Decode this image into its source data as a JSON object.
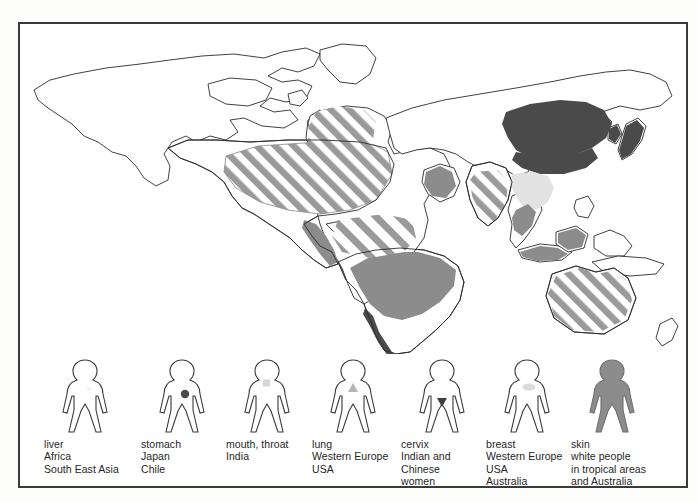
{
  "figure": {
    "frame_color": "#3a3a3a",
    "background": "#ffffff"
  },
  "palette": {
    "outline": "#2b2b2b",
    "dark_fill": "#4a4a4a",
    "mid_fill": "#8c8c8c",
    "stripe_fill": "#9a9a9a",
    "light_fill": "#e2e2e2",
    "very_light_fill": "#efefef",
    "text": "#262626"
  },
  "map": {
    "name": "world-outline-map",
    "projection_note": "flat world outline",
    "regions": [
      {
        "id": "north-america-usa",
        "label": "USA",
        "pattern": "diagonal-stripes",
        "cancer": "lung"
      },
      {
        "id": "south-america-brazil",
        "label": "Brazil / tropical South America",
        "pattern": "solid-mid",
        "cancer": "liver"
      },
      {
        "id": "chile-coast",
        "label": "Chile",
        "pattern": "solid-dark",
        "cancer": "stomach"
      },
      {
        "id": "central-america",
        "label": "Central America",
        "pattern": "solid-mid",
        "cancer": "liver"
      },
      {
        "id": "western-europe",
        "label": "Western Europe",
        "pattern": "diagonal-stripes",
        "cancer": "lung, breast"
      },
      {
        "id": "central-africa",
        "label": "Africa",
        "pattern": "diagonal-stripes-sparse",
        "cancer": "liver"
      },
      {
        "id": "middle-east-arabia",
        "label": "Arabian peninsula",
        "pattern": "solid-mid",
        "cancer": "liver"
      },
      {
        "id": "india",
        "label": "India",
        "pattern": "diagonal-stripes",
        "cancer": "mouth, throat"
      },
      {
        "id": "china",
        "label": "China",
        "pattern": "solid-dark",
        "cancer": "stomach / cervix"
      },
      {
        "id": "japan",
        "label": "Japan",
        "pattern": "solid-dark",
        "cancer": "stomach"
      },
      {
        "id": "korea",
        "label": "Korea",
        "pattern": "solid-dark",
        "cancer": "stomach"
      },
      {
        "id": "south-east-asia",
        "label": "South East Asia",
        "pattern": "solid-mid",
        "cancer": "liver"
      },
      {
        "id": "indochina",
        "label": "Indochina",
        "pattern": "light",
        "cancer": "liver"
      },
      {
        "id": "australia",
        "label": "Australia",
        "pattern": "diagonal-stripes",
        "cancer": "breast, skin"
      }
    ]
  },
  "legend": {
    "name": "cancer-legend",
    "items": [
      {
        "key": "liver",
        "marker": "none",
        "marker_color": "#f2f2f2",
        "figure_fill": "none",
        "lines": [
          "liver",
          "Africa",
          "South East Asia"
        ]
      },
      {
        "key": "stomach",
        "marker": "circle",
        "marker_color": "#4a4a4a",
        "figure_fill": "none",
        "lines": [
          "stomach",
          "Japan",
          "Chile"
        ]
      },
      {
        "key": "mouth-throat",
        "marker": "square",
        "marker_color": "#d6d6d6",
        "figure_fill": "none",
        "lines": [
          "mouth, throat",
          "India"
        ]
      },
      {
        "key": "lung",
        "marker": "triangle-up",
        "marker_color": "#b5b5b5",
        "figure_fill": "none",
        "lines": [
          "lung",
          "Western Europe",
          "USA"
        ]
      },
      {
        "key": "cervix",
        "marker": "triangle-down",
        "marker_color": "#3d3d3d",
        "figure_fill": "none",
        "lines": [
          "cervix",
          "Indian and",
          "Chinese",
          "women"
        ]
      },
      {
        "key": "breast",
        "marker": "blob",
        "marker_color": "#dcdcdc",
        "figure_fill": "none",
        "lines": [
          "breast",
          "Western Europe",
          "USA",
          "Australia"
        ]
      },
      {
        "key": "skin",
        "marker": "none",
        "marker_color": "#8c8c8c",
        "figure_fill": "#8c8c8c",
        "lines": [
          "skin",
          "white people",
          "in tropical areas",
          "and Australia"
        ]
      }
    ]
  }
}
